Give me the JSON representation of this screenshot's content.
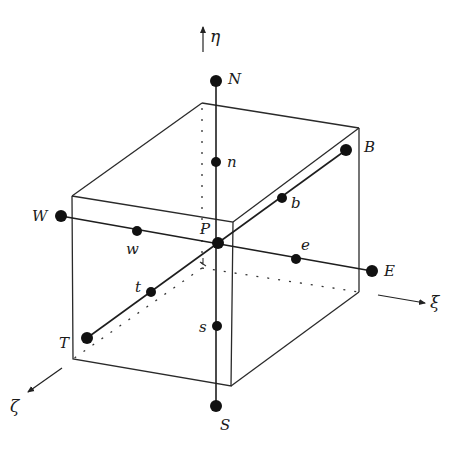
{
  "diagram": {
    "axes": {
      "eta": {
        "label": "η",
        "direction": "up"
      },
      "xi": {
        "label": "ξ",
        "direction": "right-down"
      },
      "zeta": {
        "label": "ζ",
        "direction": "left-down"
      }
    },
    "nodes": {
      "P": {
        "label": "P",
        "x": 218,
        "y": 243
      },
      "N": {
        "label": "N",
        "x": 216,
        "y": 81
      },
      "S": {
        "label": "S",
        "x": 216,
        "y": 406
      },
      "W": {
        "label": "W",
        "x": 61,
        "y": 216
      },
      "E": {
        "label": "E",
        "x": 372,
        "y": 271
      },
      "B": {
        "label": "B",
        "x": 346,
        "y": 150
      },
      "T": {
        "label": "T",
        "x": 87,
        "y": 338
      }
    },
    "faces": {
      "n": {
        "label": "n",
        "x": 216,
        "y": 162
      },
      "s": {
        "label": "s",
        "x": 217,
        "y": 326
      },
      "w": {
        "label": "w",
        "x": 137,
        "y": 231
      },
      "e": {
        "label": "e",
        "x": 296,
        "y": 259
      },
      "b": {
        "label": "b",
        "x": 282,
        "y": 198
      },
      "t": {
        "label": "t",
        "x": 151,
        "y": 292
      }
    },
    "colors": {
      "line": "#222222",
      "node": "#111111",
      "background": "#ffffff"
    }
  }
}
